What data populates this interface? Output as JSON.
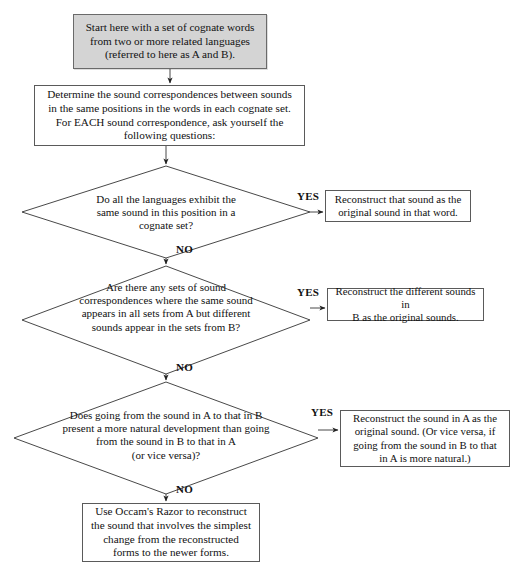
{
  "diagram": {
    "type": "flowchart",
    "line_color": "#333333",
    "shaded_fill": "#d4d4d4"
  },
  "nodes": {
    "start": {
      "shape": "process-shaded",
      "text": "Start here with a set of cognate words\nfrom two or more related languages\n(referred to here as A and B)."
    },
    "determine": {
      "shape": "process",
      "text": "Determine the sound correspondences between sounds\nin the same positions in the words in each cognate set.\nFor EACH sound correspondence, ask yourself the\nfollowing questions:"
    },
    "decision_1": {
      "shape": "decision",
      "text": "Do all the languages exhibit the\nsame sound in this position in a\ncognate set?"
    },
    "decision_2": {
      "shape": "decision",
      "text": "Are there any sets of sound\ncorrespondences where the same sound\nappears in all sets from A but different\nsounds appear in the sets from B?"
    },
    "decision_3": {
      "shape": "decision",
      "text": "Does going from the sound in A to that in B\npresent a more natural development than going\nfrom the sound in B to that in A\n(or vice versa)?"
    },
    "result_1": {
      "shape": "process",
      "text": "Reconstruct that sound as the\noriginal sound in that word."
    },
    "result_2": {
      "shape": "process",
      "text": "Reconstruct the different sounds in\nB as the original sounds."
    },
    "result_3": {
      "shape": "process",
      "text": "Reconstruct the sound in A as the\noriginal sound. (Or vice versa, if\ngoing from the sound in B to that\nin A is more natural.)"
    },
    "final": {
      "shape": "process",
      "text": "Use Occam's Razor to reconstruct\nthe sound that involves the simplest\nchange from the reconstructed\nforms to the newer forms."
    }
  },
  "edges": {
    "yes_1": "YES",
    "yes_2": "YES",
    "yes_3": "YES",
    "no_1": "NO",
    "no_2": "NO",
    "no_3": "NO"
  }
}
